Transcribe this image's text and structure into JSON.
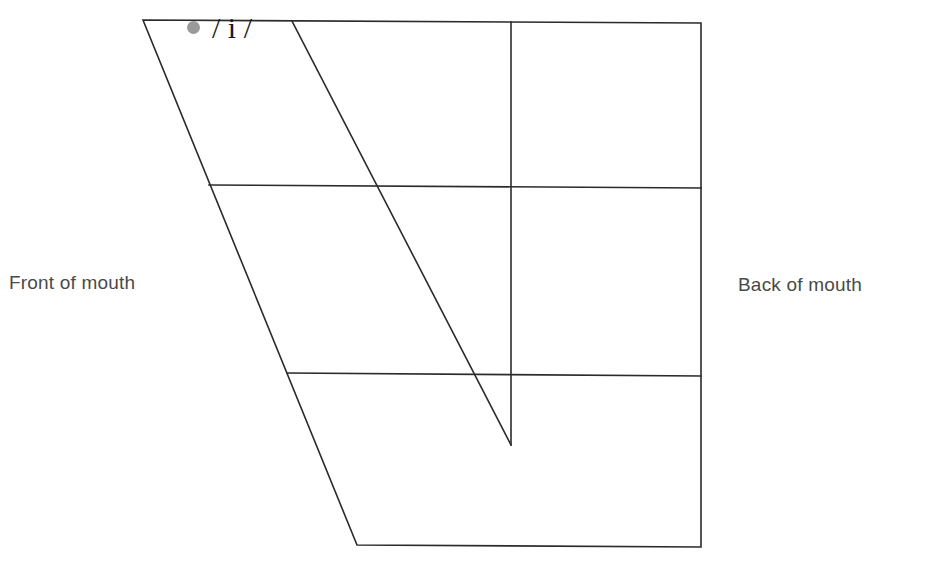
{
  "diagram": {
    "type": "vowel-quadrilateral",
    "labels": {
      "front": "Front of mouth",
      "back": "Back of mouth"
    },
    "vowels": [
      {
        "symbol": "/ i /",
        "marker_color": "#9a9a9a"
      }
    ],
    "colors": {
      "line": "#2b2b2b",
      "text": "#4a4a4a",
      "marker": "#9a9a9a",
      "background": "#ffffff"
    }
  }
}
